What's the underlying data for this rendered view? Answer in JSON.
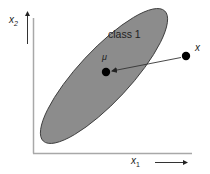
{
  "diagram": {
    "type": "scatter-ellipse",
    "axes": {
      "x_label_base": "x",
      "x_label_sub": "1",
      "y_label_base": "x",
      "y_label_sub": "2"
    },
    "class_region": {
      "label": "class 1",
      "fill": "#8c8c8c",
      "stroke": "#3a3a3a"
    },
    "points": {
      "mean": {
        "label": "μ",
        "x": 106,
        "y": 72
      },
      "sample": {
        "label": "x",
        "x": 186,
        "y": 56
      }
    },
    "colors": {
      "axis": "#a0a0a0",
      "arrow": "#333333",
      "point": "#000000",
      "text": "#222222"
    }
  }
}
